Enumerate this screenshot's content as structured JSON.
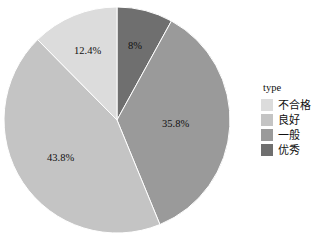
{
  "chart_data": {
    "type": "pie",
    "title": "",
    "xlabel": "",
    "ylabel": "",
    "legend_position": "right",
    "grid": false,
    "start_angle_deg": 0,
    "direction": "clockwise",
    "categories": [
      "优秀",
      "一般",
      "良好",
      "不合格"
    ],
    "values": [
      8.0,
      35.8,
      43.8,
      12.4
    ],
    "labels": [
      "8%",
      "35.8%",
      "43.8%",
      "12.4%"
    ],
    "colors": [
      "#6f6f6f",
      "#9a9a9a",
      "#c4c4c4",
      "#dcdcdc"
    ],
    "slices": [
      {
        "category": "优秀",
        "value": 8.0,
        "label": "8%",
        "color": "#6f6f6f"
      },
      {
        "category": "一般",
        "value": 35.8,
        "label": "35.8%",
        "color": "#9a9a9a"
      },
      {
        "category": "良好",
        "value": 43.8,
        "label": "43.8%",
        "color": "#c4c4c4"
      },
      {
        "category": "不合格",
        "value": 12.4,
        "label": "12.4%",
        "color": "#dcdcdc"
      }
    ]
  },
  "legend": {
    "title": "type",
    "items": [
      {
        "label": "不合格",
        "color": "#dcdcdc"
      },
      {
        "label": "良好",
        "color": "#c4c4c4"
      },
      {
        "label": "一般",
        "color": "#9a9a9a"
      },
      {
        "label": "优秀",
        "color": "#6f6f6f"
      }
    ]
  },
  "geometry": {
    "center_x": 117,
    "center_y": 120,
    "radius": 113
  },
  "label_positions": [
    {
      "text": "8%",
      "x": 128,
      "y": 40
    },
    {
      "text": "35.8%",
      "x": 162,
      "y": 118
    },
    {
      "text": "43.8%",
      "x": 47,
      "y": 152
    },
    {
      "text": "12.4%",
      "x": 74,
      "y": 45
    }
  ]
}
